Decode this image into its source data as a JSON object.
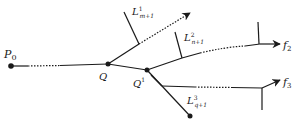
{
  "diagram": {
    "type": "branching-path-diagram",
    "colors": {
      "stroke": "#1a1a1a",
      "background": "#ffffff"
    },
    "nodes": [
      {
        "id": "P0",
        "label": "P",
        "subscript": "0",
        "x": 11,
        "y": 66
      },
      {
        "id": "Q",
        "label": "Q",
        "superscript": "",
        "x": 108,
        "y": 64
      },
      {
        "id": "Q1",
        "label": "Q",
        "superscript": "1",
        "x": 147,
        "y": 70
      },
      {
        "id": "end3",
        "label": "",
        "x": 190,
        "y": 116
      }
    ],
    "lines": [
      {
        "id": "L1",
        "label": "L",
        "superscript": "1",
        "subscript": "m+1"
      },
      {
        "id": "L2",
        "label": "L",
        "superscript": "2",
        "subscript": "n+1"
      },
      {
        "id": "L3",
        "label": "L",
        "superscript": "3",
        "subscript": "q+1"
      }
    ],
    "targets": [
      {
        "id": "f2",
        "label": "f",
        "subscript": "2"
      },
      {
        "id": "f3",
        "label": "f",
        "subscript": "3"
      }
    ]
  }
}
